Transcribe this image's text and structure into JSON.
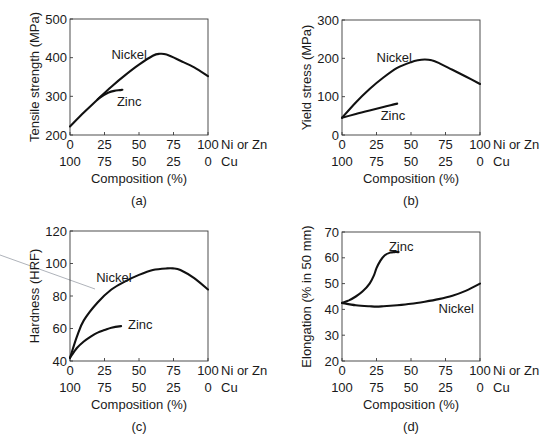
{
  "figure": {
    "panels": [
      "a",
      "b",
      "c",
      "d"
    ]
  },
  "chart_data": [
    {
      "id": "a",
      "type": "line",
      "panel_label": "(a)",
      "title": "",
      "xlabel": "Composition (%)",
      "ylabel": "Tensile strength (MPa)",
      "ylim": [
        200,
        500
      ],
      "yticks": [
        200,
        300,
        400,
        500
      ],
      "xlim": [
        0,
        100
      ],
      "xticks_primary": [
        0,
        25,
        50,
        75,
        100
      ],
      "xticks_secondary": [
        100,
        75,
        50,
        25,
        0
      ],
      "x_primary_label": "Ni or Zn",
      "x_secondary_label": "Cu",
      "grid": false,
      "box": {
        "left": 70,
        "top": 19,
        "right": 208,
        "bottom": 135
      },
      "series": [
        {
          "name": "Nickel",
          "label_pos": [
            30,
            408
          ],
          "x": [
            0,
            10,
            20,
            30,
            40,
            50,
            60,
            65,
            70,
            80,
            90,
            100
          ],
          "y": [
            222,
            258,
            292,
            325,
            355,
            382,
            405,
            410,
            408,
            392,
            375,
            352
          ]
        },
        {
          "name": "Zinc",
          "label_pos": [
            34,
            286
          ],
          "x": [
            20,
            24,
            28,
            32,
            36,
            38
          ],
          "y": [
            292,
            302,
            310,
            314,
            316,
            317
          ]
        }
      ]
    },
    {
      "id": "b",
      "type": "line",
      "panel_label": "(b)",
      "title": "",
      "xlabel": "Composition (%)",
      "ylabel": "Yield stress (MPa)",
      "ylim": [
        0,
        300
      ],
      "yticks": [
        0,
        100,
        200,
        300
      ],
      "xlim": [
        0,
        100
      ],
      "xticks_primary": [
        0,
        25,
        50,
        75,
        100
      ],
      "xticks_secondary": [
        100,
        75,
        50,
        25,
        0
      ],
      "x_primary_label": "Ni or Zn",
      "x_secondary_label": "Cu",
      "grid": false,
      "box": {
        "left": 342,
        "top": 20,
        "right": 480,
        "bottom": 135
      },
      "series": [
        {
          "name": "Nickel",
          "label_pos": [
            25,
            200
          ],
          "x": [
            0,
            10,
            20,
            30,
            40,
            50,
            55,
            60,
            65,
            70,
            80,
            90,
            100
          ],
          "y": [
            45,
            85,
            120,
            150,
            175,
            190,
            195,
            197,
            195,
            188,
            170,
            152,
            133
          ]
        },
        {
          "name": "Zinc",
          "label_pos": [
            28,
            50
          ],
          "x": [
            0,
            10,
            20,
            30,
            40
          ],
          "y": [
            45,
            55,
            64,
            73,
            82
          ]
        }
      ]
    },
    {
      "id": "c",
      "type": "line",
      "panel_label": "(c)",
      "title": "",
      "xlabel": "Composition (%)",
      "ylabel": "Hardness (HRF)",
      "ylim": [
        40,
        120
      ],
      "yticks": [
        40,
        60,
        80,
        100,
        120
      ],
      "xlim": [
        0,
        100
      ],
      "xticks_primary": [
        0,
        25,
        50,
        75,
        100
      ],
      "xticks_secondary": [
        100,
        75,
        50,
        25,
        0
      ],
      "x_primary_label": "Ni or Zn",
      "x_secondary_label": "Cu",
      "grid": false,
      "box": {
        "left": 70,
        "top": 231,
        "right": 208,
        "bottom": 361
      },
      "series": [
        {
          "name": "Nickel",
          "label_pos": [
            19,
            91
          ],
          "x": [
            0,
            5,
            10,
            20,
            30,
            40,
            50,
            60,
            70,
            75,
            80,
            90,
            100
          ],
          "y": [
            42,
            55,
            65,
            76,
            84,
            89,
            93,
            96,
            97,
            97,
            96,
            91,
            84
          ]
        },
        {
          "name": "Zinc",
          "label_pos": [
            42,
            62
          ],
          "x": [
            0,
            5,
            10,
            15,
            20,
            25,
            30,
            37
          ],
          "y": [
            42,
            48,
            52,
            55,
            57.5,
            59,
            60.5,
            61.5
          ]
        }
      ]
    },
    {
      "id": "d",
      "type": "line",
      "panel_label": "(d)",
      "title": "",
      "xlabel": "Composition (%)",
      "ylabel": "Elongation (% in 50 mm)",
      "ylim": [
        20,
        70
      ],
      "yticks": [
        20,
        30,
        40,
        50,
        60,
        70
      ],
      "xlim": [
        0,
        100
      ],
      "xticks_primary": [
        0,
        25,
        50,
        75,
        100
      ],
      "xticks_secondary": [
        100,
        75,
        50,
        25,
        0
      ],
      "x_primary_label": "Ni or Zn",
      "x_secondary_label": "Cu",
      "grid": false,
      "box": {
        "left": 342,
        "top": 232,
        "right": 480,
        "bottom": 361
      },
      "series": [
        {
          "name": "Nickel",
          "label_pos": [
            70,
            40
          ],
          "x": [
            0,
            10,
            20,
            25,
            30,
            40,
            50,
            60,
            70,
            80,
            90,
            100
          ],
          "y": [
            42.5,
            41.6,
            41.2,
            41.1,
            41.2,
            41.6,
            42.2,
            43.0,
            44.0,
            45.3,
            47.3,
            50.0
          ]
        },
        {
          "name": "Zinc",
          "label_pos": [
            34,
            64
          ],
          "x": [
            0,
            5,
            10,
            15,
            20,
            23,
            25,
            28,
            31,
            35,
            38,
            41
          ],
          "y": [
            42.5,
            43.5,
            45,
            47,
            50,
            53,
            56,
            59,
            61,
            62,
            62.2,
            62.2
          ]
        }
      ]
    }
  ]
}
